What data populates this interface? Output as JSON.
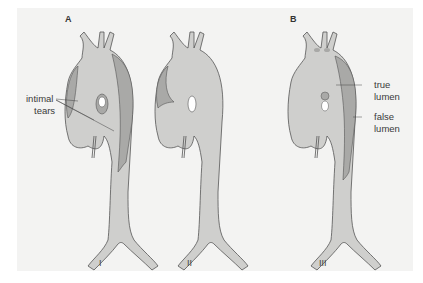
{
  "figure": {
    "panels": [
      {
        "letter": "A"
      },
      {
        "letter": "B"
      }
    ],
    "annotations": {
      "intimal_tears_line1": "intimal",
      "intimal_tears_line2": "tears",
      "true_lumen_line1": "true",
      "true_lumen_line2": "lumen",
      "false_lumen_line1": "false",
      "false_lumen_line2": "lumen"
    },
    "types": [
      {
        "numeral": "I"
      },
      {
        "numeral": "II"
      },
      {
        "numeral": "III"
      }
    ],
    "colors": {
      "background": "#f3f3f2",
      "vessel_fill": "#cfcfcd",
      "false_lumen_fill": "#a9a9a7",
      "outline": "#555555"
    }
  }
}
